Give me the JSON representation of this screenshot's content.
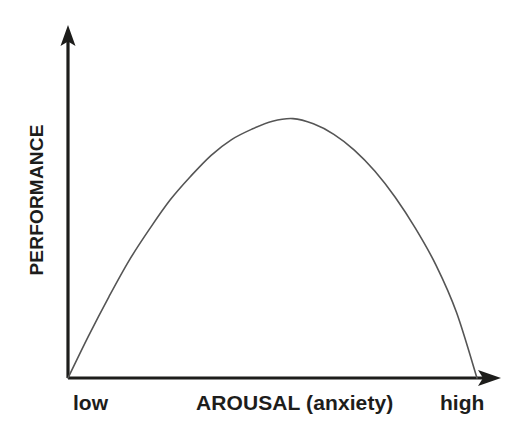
{
  "figure": {
    "background_color": "#ffffff",
    "axis_color": "#1d1d1b",
    "curve_color": "#555555",
    "y_axis_label": "PERFORMANCE",
    "x_axis_title": "AROUSAL (anxiety)",
    "x_axis_low_label": "low",
    "x_axis_high_label": "high"
  },
  "chart_data": {
    "type": "line",
    "title": "",
    "subtitle": "",
    "xlabel": "AROUSAL (anxiety)",
    "ylabel": "PERFORMANCE",
    "xlim": [
      0,
      100
    ],
    "ylim": [
      0,
      100
    ],
    "grid": false,
    "legend": false,
    "legend_position": "none",
    "axis_style": "arrow-headed open axes, no tick marks, no tick labels",
    "tick_labels": {
      "x": [
        "low",
        "high"
      ],
      "y": []
    },
    "annotations": [],
    "series": [
      {
        "name": "Performance vs Arousal (inverted-U)",
        "color": "#555555",
        "shape": "inverted-U, asymmetric: steep rise, rounded peak, longer gradual descent",
        "x": [
          0,
          5,
          10,
          15,
          20,
          25,
          30,
          35,
          40,
          45,
          50,
          55,
          60,
          65,
          70,
          75,
          80,
          85,
          90,
          95,
          100
        ],
        "y": [
          0,
          16,
          31,
          45,
          57,
          68,
          77,
          85,
          91,
          95,
          98,
          99,
          97,
          93,
          87,
          79,
          69,
          57,
          43,
          25,
          0
        ]
      }
    ],
    "peak": {
      "x": 51,
      "y": 100,
      "note": "optimal arousal yields maximum performance"
    }
  }
}
